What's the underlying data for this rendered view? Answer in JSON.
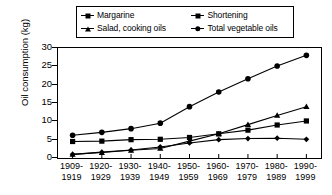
{
  "chart_data": {
    "type": "line",
    "title": "",
    "xlabel": "",
    "ylabel": "Oil consumption (kg)",
    "ylim": [
      0,
      30
    ],
    "yticks": [
      0,
      5,
      10,
      15,
      20,
      25,
      30
    ],
    "grid": false,
    "legend_position": "top",
    "categories": [
      "1909-1919",
      "1920-1929",
      "1930-1939",
      "1940-1949",
      "1950-1959",
      "1960-1969",
      "1970-1979",
      "1980-1989",
      "1990-1999"
    ],
    "category_lines": [
      [
        "1909-",
        "1919"
      ],
      [
        "1920-",
        "1929"
      ],
      [
        "1930-",
        "1939"
      ],
      [
        "1940-",
        "1949"
      ],
      [
        "1950-",
        "1959"
      ],
      [
        "1960-",
        "1969"
      ],
      [
        "1970-",
        "1979"
      ],
      [
        "1980-",
        "1989"
      ],
      [
        "1990-",
        "1999"
      ]
    ],
    "series": [
      {
        "name": "Margarine",
        "marker": "diamond",
        "color": "#000000",
        "values": [
          1.0,
          1.6,
          2.2,
          3.0,
          4.1,
          5.0,
          5.3,
          5.4,
          5.1
        ]
      },
      {
        "name": "Shortening",
        "marker": "square",
        "color": "#000000",
        "values": [
          4.5,
          4.6,
          5.0,
          5.1,
          5.6,
          6.6,
          7.6,
          9.0,
          10.1
        ]
      },
      {
        "name": "Salad, cooking oils",
        "marker": "triangle",
        "color": "#000000",
        "values": [
          1.0,
          1.5,
          2.1,
          2.6,
          4.6,
          6.6,
          9.1,
          11.6,
          14.0
        ]
      },
      {
        "name": "Total vegetable oils",
        "marker": "circle",
        "color": "#000000",
        "values": [
          6.2,
          7.0,
          8.0,
          9.5,
          14.0,
          18.0,
          21.6,
          25.1,
          28.0
        ]
      }
    ]
  },
  "legend": {
    "entries": [
      {
        "label": "Margarine",
        "marker": "diamond"
      },
      {
        "label": "Shortening",
        "marker": "square"
      },
      {
        "label": "Salad, cooking oils",
        "marker": "triangle"
      },
      {
        "label": "Total vegetable oils",
        "marker": "circle"
      }
    ]
  }
}
